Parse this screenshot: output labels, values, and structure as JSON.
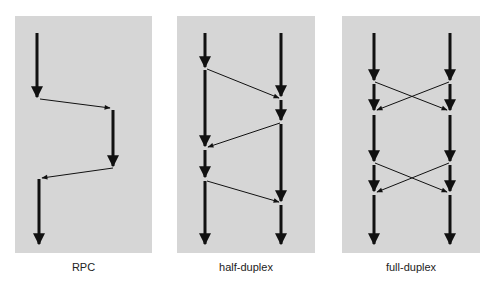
{
  "colors": {
    "panel_bg": "#d6d6d6",
    "line": "#111111",
    "page_bg": "#ffffff"
  },
  "panels": [
    {
      "id": "rpc",
      "label": "RPC",
      "x": 15,
      "y": 16,
      "width": 137,
      "height": 237
    },
    {
      "id": "half-duplex",
      "label": "half-duplex",
      "x": 177,
      "y": 16,
      "width": 138,
      "height": 237
    },
    {
      "id": "full-duplex",
      "label": "full-duplex",
      "x": 342,
      "y": 16,
      "width": 138,
      "height": 237
    }
  ],
  "diagram": {
    "rpc": {
      "timelines": [
        [
          37,
          33,
          37,
          97
        ],
        [
          113,
          110,
          113,
          166
        ],
        [
          39,
          179,
          39,
          244
        ]
      ],
      "messages": [
        [
          40,
          99,
          110,
          108
        ],
        [
          113,
          168,
          42,
          178
        ]
      ]
    },
    "half_duplex": {
      "timelines": [
        [
          205,
          33,
          205,
          67
        ],
        [
          205,
          70,
          205,
          146
        ],
        [
          205,
          150,
          205,
          177
        ],
        [
          205,
          181,
          205,
          244
        ],
        [
          281,
          33,
          281,
          96
        ],
        [
          281,
          100,
          281,
          120
        ],
        [
          281,
          124,
          281,
          201
        ],
        [
          281,
          205,
          281,
          244
        ]
      ],
      "messages": [
        [
          207,
          69,
          279,
          98
        ],
        [
          280,
          123,
          208,
          147
        ],
        [
          207,
          181,
          279,
          202
        ]
      ]
    },
    "full_duplex": {
      "timelines": [
        [
          374,
          33,
          374,
          80
        ],
        [
          374,
          84,
          374,
          110
        ],
        [
          374,
          115,
          374,
          161
        ],
        [
          374,
          165,
          374,
          191
        ],
        [
          374,
          195,
          374,
          244
        ],
        [
          450,
          33,
          450,
          80
        ],
        [
          450,
          84,
          450,
          110
        ],
        [
          450,
          115,
          450,
          161
        ],
        [
          450,
          165,
          450,
          191
        ],
        [
          450,
          195,
          450,
          244
        ]
      ],
      "messages": [
        [
          375,
          82,
          447,
          110
        ],
        [
          449,
          82,
          377,
          110
        ],
        [
          375,
          163,
          447,
          192
        ],
        [
          449,
          163,
          377,
          192
        ]
      ]
    }
  }
}
